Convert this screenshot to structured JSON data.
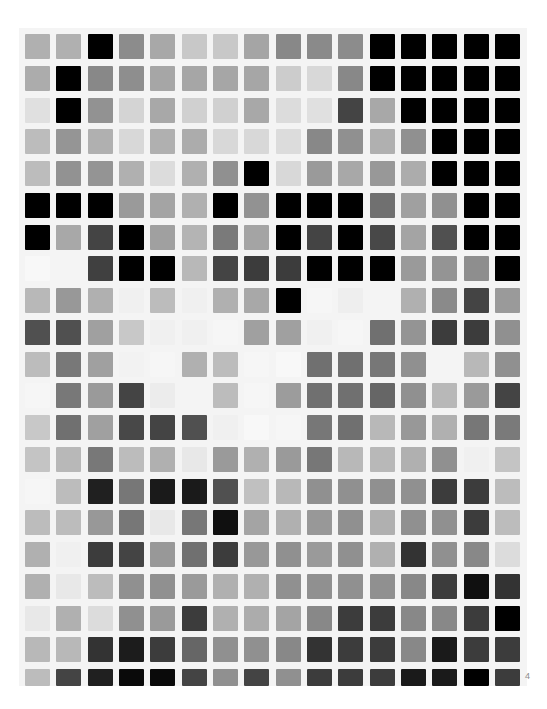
{
  "page": {
    "background": "#ffffff",
    "gutter_color": "#f4f4f4",
    "page_number": "4"
  },
  "grid": {
    "rows": 21,
    "cols": 16,
    "origin_x": 25,
    "origin_y": 34,
    "pitch_x": 31.33,
    "pitch_y": 31.75,
    "cell_size": 25,
    "clip_bottom": 686,
    "cells": [
      [
        "#b0b0b0",
        "#b0b0b0",
        "#000000",
        "#8c8c8c",
        "#a8a8a8",
        "#c8c8c8",
        "#c8c8c8",
        "#a5a5a5",
        "#888888",
        "#8a8a8a",
        "#8c8c8c",
        "#000000",
        "#000000",
        "#000000",
        "#000000",
        "#000000"
      ],
      [
        "#acacac",
        "#000000",
        "#888888",
        "#8e8e8e",
        "#a6a6a6",
        "#a6a6a6",
        "#a6a6a6",
        "#a6a6a6",
        "#cccccc",
        "#d8d8d8",
        "#888888",
        "#000000",
        "#000000",
        "#000000",
        "#000000",
        "#000000"
      ],
      [
        "#e0e0e0",
        "#000000",
        "#929292",
        "#d4d4d4",
        "#a8a8a8",
        "#d0d0d0",
        "#d0d0d0",
        "#a8a8a8",
        "#dcdcdc",
        "#e0e0e0",
        "#444444",
        "#a8a8a8",
        "#000000",
        "#000000",
        "#000000",
        "#000000"
      ],
      [
        "#bcbcbc",
        "#959595",
        "#b0b0b0",
        "#d8d8d8",
        "#b0b0b0",
        "#acacac",
        "#d8d8d8",
        "#d8d8d8",
        "#dcdcdc",
        "#888888",
        "#909090",
        "#b0b0b0",
        "#909090",
        "#000000",
        "#000000",
        "#000000"
      ],
      [
        "#bcbcbc",
        "#929292",
        "#949494",
        "#b0b0b0",
        "#dcdcdc",
        "#b0b0b0",
        "#909090",
        "#000000",
        "#d8d8d8",
        "#9a9a9a",
        "#a8a8a8",
        "#989898",
        "#acacac",
        "#000000",
        "#000000",
        "#000000"
      ],
      [
        "#000000",
        "#000000",
        "#000000",
        "#9a9a9a",
        "#a4a4a4",
        "#b0b0b0",
        "#000000",
        "#929292",
        "#000000",
        "#000000",
        "#000000",
        "#707070",
        "#a0a0a0",
        "#909090",
        "#000000",
        "#000000"
      ],
      [
        "#000000",
        "#a8a8a8",
        "#444444",
        "#000000",
        "#a0a0a0",
        "#b4b4b4",
        "#7a7a7a",
        "#a4a4a4",
        "#000000",
        "#444444",
        "#000000",
        "#484848",
        "#a4a4a4",
        "#505050",
        "#000000",
        "#000000"
      ],
      [
        "#f8f8f8",
        "#f4f4f4",
        "#404040",
        "#000000",
        "#000000",
        "#b8b8b8",
        "#444444",
        "#3c3c3c",
        "#3c3c3c",
        "#000000",
        "#000000",
        "#000000",
        "#9a9a9a",
        "#949494",
        "#8e8e8e",
        "#000000"
      ],
      [
        "#b8b8b8",
        "#989898",
        "#b0b0b0",
        "#f0f0f0",
        "#bcbcbc",
        "#f0f0f0",
        "#b0b0b0",
        "#a8a8a8",
        "#000000",
        "#f6f6f6",
        "#eeeeee",
        "#f4f4f4",
        "#b0b0b0",
        "#8a8a8a",
        "#444444",
        "#9a9a9a"
      ],
      [
        "#505050",
        "#505050",
        "#a0a0a0",
        "#c8c8c8",
        "#f0f0f0",
        "#f0f0f0",
        "#f6f6f6",
        "#a0a0a0",
        "#a0a0a0",
        "#f0f0f0",
        "#f6f6f6",
        "#707070",
        "#949494",
        "#3c3c3c",
        "#3c3c3c",
        "#909090"
      ],
      [
        "#bcbcbc",
        "#787878",
        "#a0a0a0",
        "#f2f2f2",
        "#f6f6f6",
        "#b0b0b0",
        "#bcbcbc",
        "#f6f6f6",
        "#f8f8f8",
        "#707070",
        "#707070",
        "#777777",
        "#909090",
        "#f4f4f4",
        "#b8b8b8",
        "#909090"
      ],
      [
        "#f6f6f6",
        "#787878",
        "#9a9a9a",
        "#444444",
        "#ececec",
        "#f4f4f4",
        "#bcbcbc",
        "#f6f6f6",
        "#9c9c9c",
        "#707070",
        "#707070",
        "#666666",
        "#909090",
        "#b8b8b8",
        "#9a9a9a",
        "#444444"
      ],
      [
        "#c8c8c8",
        "#707070",
        "#a0a0a0",
        "#484848",
        "#444444",
        "#505050",
        "#f0f0f0",
        "#f8f8f8",
        "#f6f6f6",
        "#777777",
        "#707070",
        "#b8b8b8",
        "#989898",
        "#b0b0b0",
        "#777777",
        "#7a7a7a"
      ],
      [
        "#c4c4c4",
        "#b8b8b8",
        "#787878",
        "#bcbcbc",
        "#b0b0b0",
        "#e8e8e8",
        "#9a9a9a",
        "#b0b0b0",
        "#9a9a9a",
        "#777777",
        "#b8b8b8",
        "#b8b8b8",
        "#b0b0b0",
        "#909090",
        "#f0f0f0",
        "#c4c4c4"
      ],
      [
        "#f6f6f6",
        "#bcbcbc",
        "#202020",
        "#777777",
        "#1a1a1a",
        "#1a1a1a",
        "#505050",
        "#c0c0c0",
        "#b8b8b8",
        "#909090",
        "#909090",
        "#909090",
        "#909090",
        "#3c3c3c",
        "#3c3c3c",
        "#bcbcbc"
      ],
      [
        "#bcbcbc",
        "#bcbcbc",
        "#989898",
        "#777777",
        "#e8e8e8",
        "#777777",
        "#101010",
        "#a4a4a4",
        "#b0b0b0",
        "#989898",
        "#909090",
        "#b0b0b0",
        "#909090",
        "#909090",
        "#3c3c3c",
        "#bcbcbc"
      ],
      [
        "#b0b0b0",
        "#f0f0f0",
        "#3c3c3c",
        "#444444",
        "#989898",
        "#707070",
        "#3c3c3c",
        "#989898",
        "#909090",
        "#9a9a9a",
        "#909090",
        "#b0b0b0",
        "#333333",
        "#909090",
        "#888888",
        "#dcdcdc"
      ],
      [
        "#b0b0b0",
        "#e8e8e8",
        "#bcbcbc",
        "#909090",
        "#909090",
        "#9a9a9a",
        "#b0b0b0",
        "#b0b0b0",
        "#909090",
        "#909090",
        "#909090",
        "#909090",
        "#888888",
        "#3c3c3c",
        "#101010",
        "#333333"
      ],
      [
        "#e8e8e8",
        "#b0b0b0",
        "#dcdcdc",
        "#909090",
        "#9a9a9a",
        "#3c3c3c",
        "#b0b0b0",
        "#acacac",
        "#a4a4a4",
        "#888888",
        "#3c3c3c",
        "#3c3c3c",
        "#888888",
        "#888888",
        "#3c3c3c",
        "#000000"
      ],
      [
        "#b8b8b8",
        "#b8b8b8",
        "#333333",
        "#1c1c1c",
        "#3c3c3c",
        "#666666",
        "#909090",
        "#909090",
        "#888888",
        "#333333",
        "#3c3c3c",
        "#3c3c3c",
        "#888888",
        "#1a1a1a",
        "#3c3c3c",
        "#3c3c3c"
      ],
      [
        "#bcbcbc",
        "#444444",
        "#202020",
        "#0a0a0a",
        "#0a0a0a",
        "#444444",
        "#909090",
        "#444444",
        "#909090",
        "#3c3c3c",
        "#3c3c3c",
        "#3c3c3c",
        "#1a1a1a",
        "#1a1a1a",
        "#000000",
        "#3c3c3c"
      ]
    ]
  }
}
